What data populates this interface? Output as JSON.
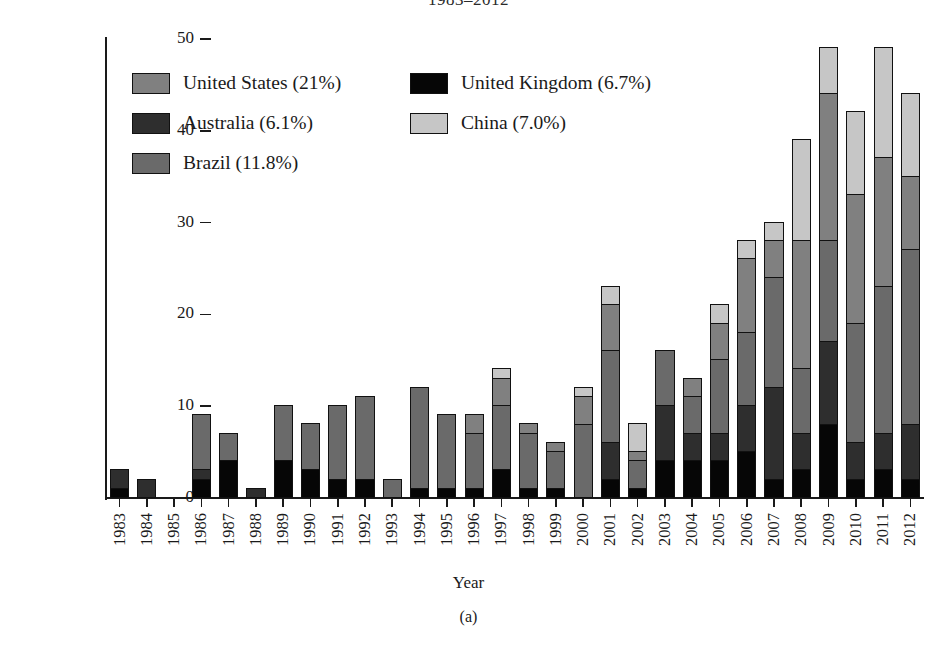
{
  "figure": {
    "title": "1983–2012",
    "subcaption": "(a)"
  },
  "chart_data": {
    "type": "bar",
    "stacked": true,
    "title": "1983–2012",
    "xlabel": "Year",
    "ylabel": "# Publications",
    "ylim": [
      0,
      50
    ],
    "yticks": [
      0,
      10,
      20,
      30,
      40,
      50
    ],
    "grid": false,
    "legend_position": "upper-left-inside",
    "categories": [
      "1983",
      "1984",
      "1985",
      "1986",
      "1987",
      "1988",
      "1989",
      "1990",
      "1991",
      "1992",
      "1993",
      "1994",
      "1995",
      "1996",
      "1997",
      "1998",
      "1999",
      "2000",
      "2001",
      "2002",
      "2003",
      "2004",
      "2005",
      "2006",
      "2007",
      "2008",
      "2009",
      "2010",
      "2011",
      "2012"
    ],
    "series": [
      {
        "name": "United Kingdom (6.7%)",
        "label": "United Kingdom",
        "percent": "6.7%",
        "color": "#060606",
        "values": [
          1,
          0,
          0,
          2,
          4,
          0,
          4,
          3,
          2,
          2,
          0,
          1,
          1,
          1,
          3,
          1,
          1,
          0,
          2,
          1,
          4,
          4,
          4,
          5,
          2,
          3,
          8,
          2,
          3,
          2
        ]
      },
      {
        "name": "Australia (6.1%)",
        "label": "Australia",
        "percent": "6.1%",
        "color": "#2e2e2e",
        "values": [
          2,
          2,
          0,
          1,
          0,
          1,
          0,
          0,
          0,
          0,
          0,
          0,
          0,
          0,
          0,
          0,
          0,
          0,
          4,
          0,
          6,
          3,
          3,
          5,
          10,
          4,
          9,
          4,
          4,
          6
        ]
      },
      {
        "name": "Brazil (11.8%)",
        "label": "Brazil",
        "percent": "11.8%",
        "color": "#6a6a6a",
        "values": [
          0,
          0,
          0,
          6,
          3,
          0,
          6,
          5,
          8,
          9,
          2,
          11,
          8,
          6,
          7,
          6,
          4,
          8,
          10,
          3,
          6,
          4,
          8,
          8,
          12,
          7,
          11,
          13,
          16,
          19
        ]
      },
      {
        "name": "United States (21%)",
        "label": "United States",
        "percent": "21%",
        "color": "#808080",
        "values": [
          0,
          0,
          0,
          0,
          0,
          0,
          0,
          0,
          0,
          0,
          0,
          0,
          0,
          2,
          3,
          1,
          1,
          3,
          5,
          1,
          0,
          2,
          4,
          8,
          4,
          14,
          16,
          14,
          14,
          8
        ]
      },
      {
        "name": "China (7.0%)",
        "label": "China",
        "percent": "7.0%",
        "color": "#c6c6c6",
        "values": [
          0,
          0,
          0,
          0,
          0,
          0,
          0,
          0,
          0,
          0,
          0,
          0,
          0,
          0,
          1,
          0,
          0,
          1,
          2,
          3,
          0,
          0,
          2,
          2,
          2,
          11,
          5,
          9,
          12,
          9
        ]
      }
    ],
    "totals": [
      3,
      2,
      0,
      9,
      7,
      1,
      10,
      8,
      10,
      11,
      2,
      12,
      9,
      9,
      14,
      8,
      6,
      12,
      23,
      8,
      16,
      13,
      21,
      28,
      30,
      39,
      49,
      42,
      49,
      36
    ]
  },
  "legend": {
    "items": [
      {
        "label": "United States (21%)",
        "color": "#808080",
        "col": 0,
        "row": 0
      },
      {
        "label": "United Kingdom (6.7%)",
        "color": "#060606",
        "col": 1,
        "row": 0
      },
      {
        "label": "Australia (6.1%)",
        "color": "#2e2e2e",
        "col": 0,
        "row": 1
      },
      {
        "label": "China (7.0%)",
        "color": "#c6c6c6",
        "col": 1,
        "row": 1
      },
      {
        "label": "Brazil (11.8%)",
        "color": "#6a6a6a",
        "col": 0,
        "row": 2
      }
    ]
  }
}
